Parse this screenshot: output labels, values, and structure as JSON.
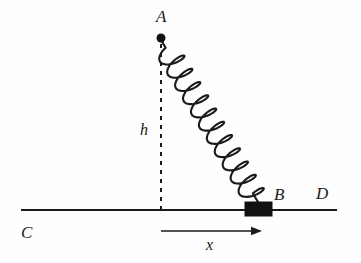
{
  "figure": {
    "background_color": "#fefefe",
    "ink_color": "#1a1a1a",
    "width": 361,
    "height": 263
  },
  "labels": {
    "point_a": "A",
    "point_b": "B",
    "point_c": "C",
    "point_d": "D",
    "height": "h",
    "displacement": "x"
  },
  "elements": {
    "anchor_point": {
      "name": "A",
      "x": 161,
      "y": 38,
      "radius": 4.5,
      "color": "#111111"
    },
    "block": {
      "name": "B",
      "x": 245,
      "y": 202,
      "width": 27,
      "height": 14,
      "color": "#111111"
    },
    "ground_line": {
      "from_label": "C",
      "to_label": "D",
      "x1": 21,
      "y1": 210,
      "x2": 337,
      "y2": 210,
      "stroke_width": 2.2,
      "color": "#1a1a1a"
    },
    "height_dashed_line": {
      "label": "h",
      "x": 161,
      "y1": 44,
      "y2": 210,
      "dash": "4 5",
      "stroke_width": 2,
      "color": "#1a1a1a"
    },
    "displacement_arrow": {
      "label": "x",
      "x1": 161,
      "y1": 231,
      "x2": 262,
      "y2": 231,
      "stroke_width": 1.6,
      "color": "#1a1a1a"
    },
    "spring": {
      "from": "A",
      "to": "B",
      "start_x": 161,
      "start_y": 40,
      "end_x": 258,
      "end_y": 202,
      "coils": 11,
      "coil_radius": 12,
      "stroke_width": 2.1,
      "color": "#1a1a1a"
    }
  },
  "label_positions": {
    "a": {
      "x": 156,
      "y": 22
    },
    "b": {
      "x": 274,
      "y": 200
    },
    "c": {
      "x": 21,
      "y": 238
    },
    "d": {
      "x": 316,
      "y": 199
    },
    "h": {
      "x": 140,
      "y": 135
    },
    "x": {
      "x": 206,
      "y": 250
    }
  }
}
